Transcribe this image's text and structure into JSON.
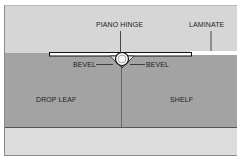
{
  "diagram": {
    "labels": {
      "piano_hinge": "PIANO HINGE",
      "laminate": "LAMINATE",
      "bevel_left": "BEVEL",
      "bevel_right": "BEVEL",
      "drop_leaf": "DROP LEAF",
      "shelf": "SHELF"
    },
    "colors": {
      "background_light": "#d6d6d6",
      "wood_panel": "#a3a3a3",
      "bottom_band": "#dcdcdc",
      "laminate": "#ffffff",
      "outline": "#111111"
    }
  }
}
